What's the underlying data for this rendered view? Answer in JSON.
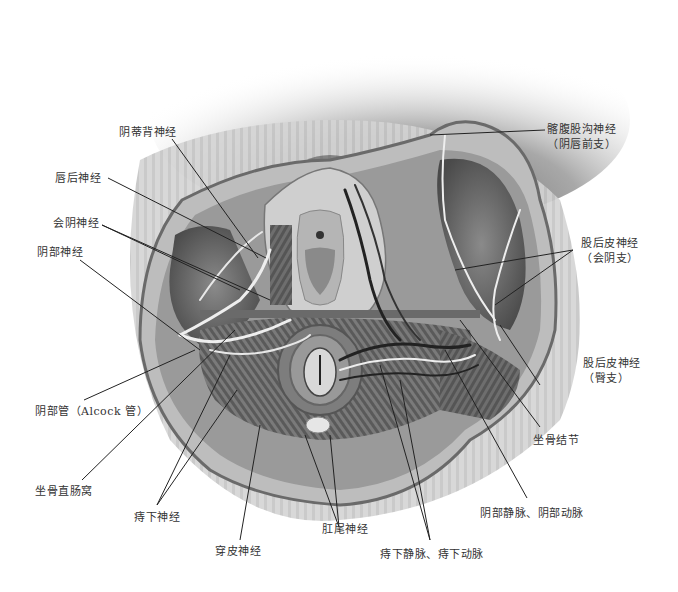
{
  "figure": {
    "type": "anatomical-illustration",
    "color_mode": "grayscale"
  },
  "labels": {
    "dorsal_nerve_clitoris": "阴蒂背神经",
    "posterior_labial_nerve": "唇后神经",
    "perineal_nerve": "会阴神经",
    "pudendal_nerve": "阴部神经",
    "pudendal_canal": "阴部管（Alcock 管）",
    "ischiorectal_fossa": "坐骨直肠窝",
    "inferior_rectal_nerve": "痔下神经",
    "perforating_cutaneous_nerve": "穿皮神经",
    "anococcygeal_nerve": "肛尾神经",
    "inferior_rectal_vessels": "痔下静脉、痔下动脉",
    "pudendal_vessels": "阴部静脉、阴部动脉",
    "ischial_tuberosity": "坐骨结节",
    "post_femoral_cutaneous_gluteal_line1": "股后皮神经",
    "post_femoral_cutaneous_gluteal_line2": "（臀支）",
    "post_femoral_cutaneous_perineal_line1": "股后皮神经",
    "post_femoral_cutaneous_perineal_line2": "（会阴支）",
    "ilioinguinal_line1": "髂腹股沟神经",
    "ilioinguinal_line2": "（阴唇前支）"
  }
}
